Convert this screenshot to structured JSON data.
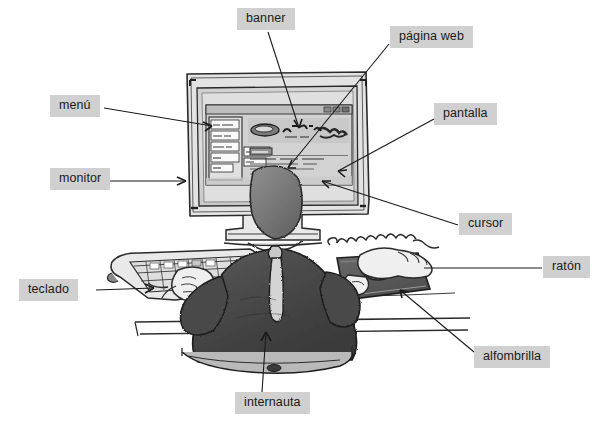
{
  "figure": {
    "background_color": "#ffffff",
    "label_box_color": "#d0d0d0",
    "label_text_color": "#1a1a1a",
    "leader_line_color": "#1a1a1a",
    "ink_color": "#2b2b2b",
    "wash_light": "#d9d9d9",
    "wash_mid": "#9a9a9a",
    "wash_dark": "#5b5b5b",
    "suit_color": "#4a4a4a",
    "top_artifact": ""
  },
  "labels": [
    {
      "id": "banner",
      "text": "banner",
      "x": 237,
      "y": 8,
      "target_x": 299,
      "target_y": 128
    },
    {
      "id": "pagina-web",
      "text": "página web",
      "x": 390,
      "y": 26,
      "target_x": 288,
      "target_y": 168
    },
    {
      "id": "menu",
      "text": "menú",
      "x": 50,
      "y": 95,
      "target_x": 212,
      "target_y": 126
    },
    {
      "id": "pantalla",
      "text": "pantalla",
      "x": 434,
      "y": 103,
      "target_x": 338,
      "target_y": 171
    },
    {
      "id": "monitor",
      "text": "monitor",
      "x": 50,
      "y": 168,
      "target_x": 188,
      "target_y": 180
    },
    {
      "id": "cursor",
      "text": "cursor",
      "x": 459,
      "y": 213,
      "target_x": 320,
      "target_y": 180
    },
    {
      "id": "raton",
      "text": "ratón",
      "x": 543,
      "y": 256,
      "target_x": 420,
      "target_y": 270
    },
    {
      "id": "teclado",
      "text": "teclado",
      "x": 19,
      "y": 279,
      "target_x": 152,
      "target_y": 285
    },
    {
      "id": "alfombrilla",
      "text": "alfombrilla",
      "x": 474,
      "y": 346,
      "target_x": 400,
      "target_y": 290
    },
    {
      "id": "internauta",
      "text": "internauta",
      "x": 235,
      "y": 392,
      "target_x": 265,
      "target_y": 355
    }
  ],
  "scene": {
    "screen_window": {
      "title_bar_buttons": "▭▭▭",
      "menu_buttons_count": 5,
      "banner_text": "Tu ip.com",
      "banner_subtext": "Para ti",
      "body_heading": "Chat",
      "body_lines": 4
    },
    "objects": [
      "monitor",
      "screen",
      "web page",
      "banner",
      "menu",
      "cursor",
      "keyboard",
      "mouse",
      "mouse cable",
      "mouse pad",
      "desk",
      "chair",
      "person seated from behind with tie"
    ]
  }
}
